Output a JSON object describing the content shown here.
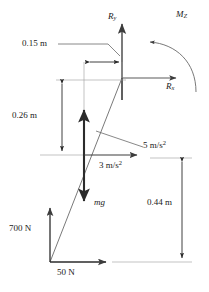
{
  "diagram": {
    "type": "free-body-diagram",
    "title_visible": false,
    "stroke_color": "#3c3c3c",
    "bold_stroke_color": "#2b2b2b",
    "text_color": "#1a1a1a",
    "background": "#ffffff"
  },
  "labels": {
    "reaction_y": "R",
    "reaction_y_sub": "y",
    "reaction_x": "R",
    "reaction_x_sub": "x",
    "moment_z": "M",
    "moment_z_sub": "Z",
    "dim_horizontal": "0.15 m",
    "dim_vertical_upper": "0.26 m",
    "dim_vertical_right": "0.44 m",
    "accel_diagonal": "5 m/s",
    "accel_diagonal_sup": "2",
    "accel_horizontal": "3 m/s",
    "accel_horizontal_sup": "2",
    "weight": "mg",
    "force_vertical": "700 N",
    "force_horizontal": "50 N"
  },
  "vectors": [
    {
      "name": "reaction-y-arrow",
      "label": "R_y",
      "direction": "up",
      "tail": [
        122,
        78
      ],
      "head": [
        122,
        18
      ]
    },
    {
      "name": "reaction-x-arrow",
      "label": "R_x",
      "direction": "right",
      "tail": [
        122,
        78
      ],
      "head": [
        181,
        78
      ]
    },
    {
      "name": "moment-z-arc",
      "label": "M_Z",
      "direction": "counterclockwise",
      "center": [
        150,
        95
      ]
    },
    {
      "name": "accel-3-arrow",
      "label": "3 m/s^2",
      "direction": "right",
      "tail": [
        84,
        155
      ],
      "head": [
        140,
        155
      ]
    },
    {
      "name": "weight-arrow",
      "label": "mg",
      "direction": "down",
      "tail": [
        84,
        155
      ],
      "head": [
        84,
        206
      ]
    },
    {
      "name": "inertia-up-arrow",
      "label": "",
      "direction": "up",
      "tail": [
        84,
        155
      ],
      "head": [
        84,
        105
      ]
    },
    {
      "name": "force-700N-arrow",
      "label": "700 N",
      "direction": "up",
      "tail": [
        50,
        262
      ],
      "head": [
        50,
        203
      ]
    },
    {
      "name": "force-50N-arrow",
      "label": "50 N",
      "direction": "right",
      "tail": [
        50,
        262
      ],
      "head": [
        110,
        262
      ]
    }
  ],
  "dimensions": [
    {
      "name": "dim-0-15-m",
      "value": "0.15 m",
      "orientation": "horizontal",
      "from": [
        87,
        62
      ],
      "to": [
        122,
        62
      ]
    },
    {
      "name": "dim-0-26-m",
      "value": "0.26 m",
      "orientation": "vertical",
      "from": [
        62,
        80
      ],
      "to": [
        62,
        155
      ]
    },
    {
      "name": "dim-0-44-m",
      "value": "0.44 m",
      "orientation": "vertical",
      "from": [
        182,
        158
      ],
      "to": [
        182,
        262
      ]
    }
  ],
  "geometry": {
    "diagonal_member": {
      "name": "slanted-member",
      "from": [
        50,
        262
      ],
      "to": [
        122,
        78
      ]
    },
    "center_of_mass": [
      84,
      155
    ]
  }
}
